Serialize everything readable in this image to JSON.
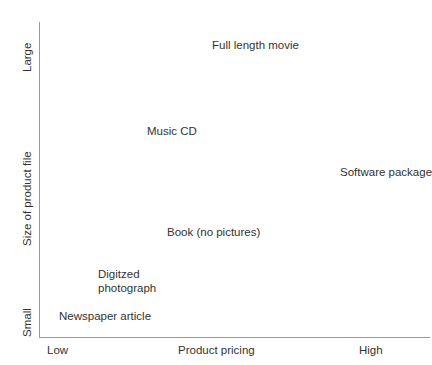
{
  "chart_data": {
    "type": "scatter",
    "title": "",
    "subtitle": "",
    "xlabel": "Product pricing",
    "ylabel": "Size of product file",
    "xlim": [
      "Low",
      "High"
    ],
    "ylim": [
      "Small",
      "Large"
    ],
    "x_tick_labels": [
      "Low",
      "High"
    ],
    "y_tick_labels": [
      "Small",
      "Large"
    ],
    "grid": false,
    "legend": false,
    "legend_position": "none",
    "marker_style": "text-only",
    "annotations": [
      {
        "label": "Full length movie",
        "x_qualitative": "medium",
        "y_qualitative": "large",
        "x": 0.45,
        "y": 0.94
      },
      {
        "label": "Music CD",
        "x_qualitative": "low-medium",
        "y_qualitative": "medium-large",
        "x": 0.3,
        "y": 0.67
      },
      {
        "label": "Software package",
        "x_qualitative": "high",
        "y_qualitative": "medium",
        "x": 0.85,
        "y": 0.54
      },
      {
        "label": "Book (no pictures)",
        "x_qualitative": "low-medium",
        "y_qualitative": "low-medium",
        "x": 0.33,
        "y": 0.35
      },
      {
        "label": "Digitzed photograph",
        "label_line_1": "Digitzed",
        "label_line_2": "photograph",
        "x_qualitative": "low",
        "y_qualitative": "small",
        "x": 0.15,
        "y": 0.22
      },
      {
        "label": "Newspaper article",
        "x_qualitative": "low",
        "y_qualitative": "small",
        "x": 0.14,
        "y": 0.08
      }
    ],
    "colors": {
      "text": "#333333",
      "axis": "#9a9a9a",
      "background": "#ffffff"
    }
  },
  "axes": {
    "y": {
      "title": "Size of product file",
      "tick_top": "Large",
      "tick_bottom": "Small"
    },
    "x": {
      "title": "Product pricing",
      "tick_left": "Low",
      "tick_right": "High"
    }
  },
  "points": {
    "full_length_movie": "Full length movie",
    "music_cd": "Music CD",
    "software_package": "Software package",
    "book_no_pictures": "Book (no pictures)",
    "digitzed_line1": "Digitzed",
    "digitzed_line2": "photograph",
    "newspaper_article": "Newspaper article"
  }
}
